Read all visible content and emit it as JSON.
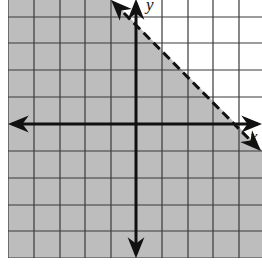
{
  "graph": {
    "type": "linear-inequality",
    "inequality": "y < -x + 4",
    "boundary": {
      "style": "dashed",
      "slope": -1,
      "y_intercept": 4
    },
    "shaded_region": "below boundary",
    "axes": {
      "x_label": "x",
      "y_label": "y"
    },
    "colors": {
      "shade": "#bdbdbd",
      "grid": "#333333",
      "axis": "#111111",
      "background": "#ffffff"
    },
    "grid": {
      "origin_px": [
        136,
        124
      ],
      "unit_x_px": 25.6,
      "unit_y_px": 26.7,
      "left_px": 8,
      "bottom_px": 258
    }
  }
}
